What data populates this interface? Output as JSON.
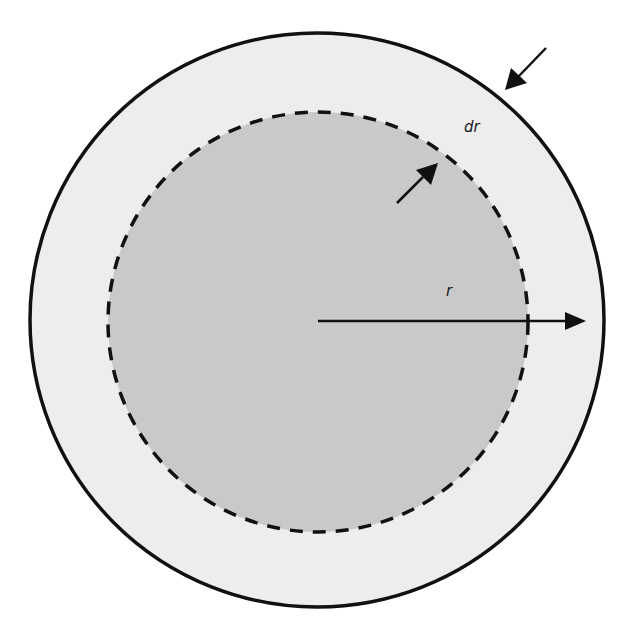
{
  "diagram": {
    "colors": {
      "background": "#ffffff",
      "outer_fill": "#ededed",
      "inner_fill": "#c9c9c9",
      "stroke": "#111111"
    },
    "outer_circle": {
      "cx": 317,
      "cy": 320,
      "r": 287
    },
    "inner_circle": {
      "cx": 318,
      "cy": 322,
      "r": 210,
      "dashed": true
    },
    "radius_arrow": {
      "x1": 318,
      "y1": 321,
      "x2": 586,
      "y2": 321
    },
    "labels": {
      "r": "r",
      "dr": "dr"
    },
    "arrows": [
      {
        "name": "outer-inward-arrow",
        "from": [
          546,
          48
        ],
        "to": [
          505,
          90
        ]
      },
      {
        "name": "inner-outward-arrow",
        "from": [
          397,
          203
        ],
        "to": [
          437,
          163
        ]
      }
    ]
  }
}
